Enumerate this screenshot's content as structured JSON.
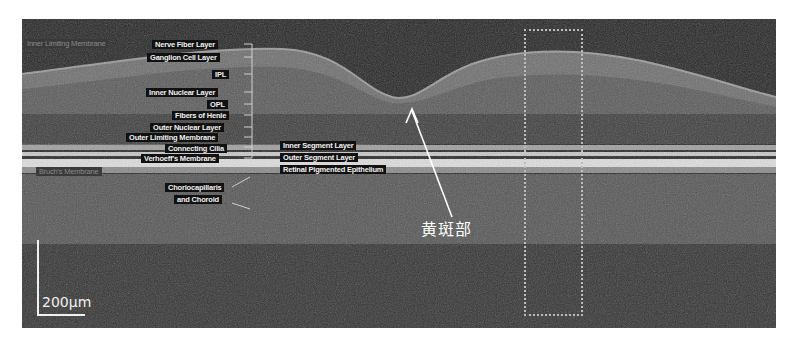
{
  "figure": {
    "type": "OCT retinal cross-section",
    "layer_labels_left": [
      {
        "text": "Inner Limiting Membrane",
        "faint": true
      },
      {
        "text": "Nerve Fiber Layer"
      },
      {
        "text": "Ganglion Cell Layer"
      },
      {
        "text": "IPL"
      },
      {
        "text": "Inner Nuclear Layer"
      },
      {
        "text": "OPL"
      },
      {
        "text": "Fibers of Henle"
      },
      {
        "text": "Outer Nuclear Layer"
      },
      {
        "text": "Outer Limiting Membrane"
      },
      {
        "text": "Connecting Cilia"
      },
      {
        "text": "Verhoeff's Membrane"
      },
      {
        "text": "Bruch's Membrane",
        "faint": true
      },
      {
        "text": "Choriocapillaris"
      },
      {
        "text": "and Choroid"
      }
    ],
    "layer_labels_right": [
      {
        "text": "Inner Segment Layer"
      },
      {
        "text": "Outer Segment Layer"
      },
      {
        "text": "Retinal Pigmented Epithelium"
      }
    ],
    "callout": {
      "text": "黄斑部",
      "target": "fovea"
    },
    "scale_bar": {
      "label": "200μm"
    },
    "colors": {
      "background": "#2a2a2a",
      "label_bg": "#111111",
      "label_text": "#f2f2f2",
      "annotation": "#ffffff"
    }
  }
}
